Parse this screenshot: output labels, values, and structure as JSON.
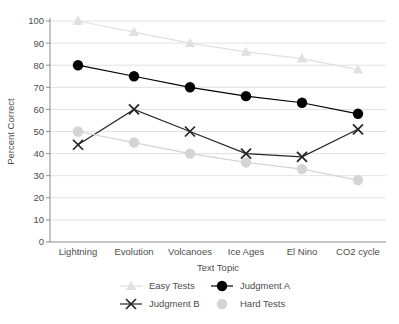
{
  "chart_data": {
    "type": "line",
    "title": "",
    "xlabel": "Text Topic",
    "ylabel": "Percent Correct",
    "categories": [
      "Lightning",
      "Evolution",
      "Volcanoes",
      "Ice Ages",
      "El Nino",
      "CO2 cycle"
    ],
    "ylim": [
      0,
      100
    ],
    "yticks": [
      0,
      10,
      20,
      30,
      40,
      50,
      60,
      70,
      80,
      90,
      100
    ],
    "grid": true,
    "legend_position": "bottom",
    "series": [
      {
        "name": "Easy Tests",
        "values": [
          100,
          95,
          90,
          86,
          83,
          78
        ],
        "color": "#e0e0e0",
        "marker": "triangle",
        "line": true
      },
      {
        "name": "Judgment A",
        "values": [
          80,
          75,
          70,
          66,
          63,
          58
        ],
        "color": "#000000",
        "marker": "circle",
        "line": true
      },
      {
        "name": "Judgment B",
        "values": [
          44,
          60,
          50,
          40,
          38.5,
          51
        ],
        "color": "#262626",
        "marker": "x",
        "line": true
      },
      {
        "name": "Hard Tests",
        "values": [
          50,
          45,
          40,
          36,
          33,
          28
        ],
        "color": "#d4d4d4",
        "marker": "circle",
        "line": true
      }
    ]
  },
  "axis": {
    "ylabel": "Percent Correct",
    "xlabel": "Text Topic",
    "ytick_labels": [
      "100",
      "90",
      "80",
      "70",
      "60",
      "50",
      "40",
      "30",
      "20",
      "10",
      "0"
    ],
    "xtick_labels": [
      "Lightning",
      "Evolution",
      "Volcanoes",
      "Ice Ages",
      "El Nino",
      "CO2 cycle"
    ]
  },
  "legend": {
    "items": [
      {
        "label": "Easy Tests",
        "marker": "triangle-icon",
        "color": "#e0e0e0"
      },
      {
        "label": "Judgment A",
        "marker": "circle-icon",
        "color": "#000000"
      },
      {
        "label": "Judgment B",
        "marker": "x-icon",
        "color": "#262626"
      },
      {
        "label": "Hard Tests",
        "marker": "circle-icon",
        "color": "#d4d4d4"
      }
    ]
  }
}
